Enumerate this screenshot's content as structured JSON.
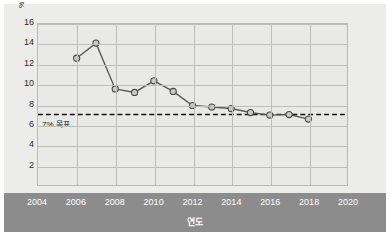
{
  "chart_data": {
    "type": "line",
    "title": "",
    "xlabel": "연도",
    "ylabel": "",
    "unit_label": "%",
    "x": [
      2006,
      2007,
      2008,
      2009,
      2010,
      2011,
      2012,
      2013,
      2014,
      2015,
      2016,
      2017,
      2018
    ],
    "values": [
      12.6,
      14.1,
      9.55,
      9.2,
      10.35,
      9.3,
      7.9,
      7.75,
      7.6,
      7.2,
      6.95,
      7.0,
      6.55
    ],
    "series": [
      {
        "name": "",
        "values": [
          12.6,
          14.1,
          9.55,
          9.2,
          10.35,
          9.3,
          7.9,
          7.75,
          7.6,
          7.2,
          6.95,
          7.0,
          6.55
        ]
      }
    ],
    "xlim": [
      2004,
      2020
    ],
    "ylim": [
      0,
      16
    ],
    "x_tick_labels": [
      "2004",
      "2006",
      "2008",
      "2010",
      "2012",
      "2014",
      "2016",
      "2018",
      "2020"
    ],
    "x_ticks": [
      2004,
      2006,
      2008,
      2010,
      2012,
      2014,
      2016,
      2018,
      2020
    ],
    "y_tick_labels": [
      "2",
      "4",
      "6",
      "8",
      "10",
      "12",
      "14",
      "16"
    ],
    "y_ticks": [
      2,
      4,
      6,
      8,
      10,
      12,
      14,
      16
    ],
    "grid": true,
    "legend": "none",
    "annotations": [
      {
        "name": "target-line",
        "type": "hline",
        "value": 7,
        "label": "7% 목표",
        "style": "dashed"
      }
    ],
    "colors": {
      "line": "#5a5a5a",
      "marker_fill": "#c9c9c7",
      "marker_stroke": "#4a4a4a",
      "target_line": "#111111",
      "plot_bg": "#e9e9e8",
      "grid": "#bdbdbb",
      "axis_band": "#8c8c8c",
      "axis_text": "#ffffff",
      "tick_text": "#2b2b2b"
    }
  }
}
